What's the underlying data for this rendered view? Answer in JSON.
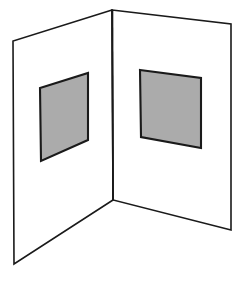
{
  "figure": {
    "title": "Folded card with two gray patches",
    "background_color": "#ffffff",
    "line_color": "#1a1a1a",
    "patch_fill_color": "#ababab",
    "patch_stroke_color": "#1a1a1a",
    "panel_fill_color": "#ffffff",
    "canvas": {
      "width": 244,
      "height": 281
    },
    "elements": {
      "left_panel": {
        "name": "left panel",
        "points": "112,10 13,41 14,264 113,200"
      },
      "right_panel": {
        "name": "right panel",
        "points": "112,10 231,24 231,230 113,200"
      },
      "fold_edge": {
        "name": "center fold edge",
        "x1": 112.5,
        "y1": 10,
        "x2": 113,
        "y2": 200
      },
      "left_patch": {
        "name": "left gray patch",
        "points": "88,73 88,140 41,161 40,88"
      },
      "right_patch": {
        "name": "right gray patch",
        "points": "140,70 201,78 201,148 141,137"
      }
    }
  }
}
